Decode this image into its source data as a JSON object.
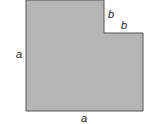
{
  "diagram": {
    "shape_fill": "#b5b5b5",
    "shape_stroke": "#555555",
    "labels": {
      "left_side": "a",
      "bottom_side": "a",
      "notch_vertical": "b",
      "notch_horizontal": "b"
    }
  }
}
